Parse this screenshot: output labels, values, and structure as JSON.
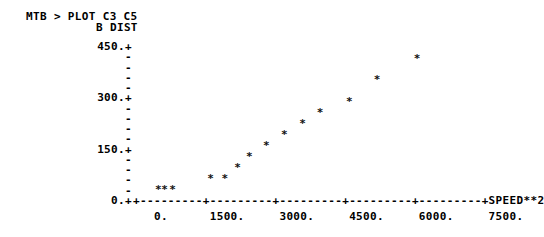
{
  "terminal": {
    "prompt_line": "MTB > PLOT C3 C5",
    "y_axis_title": "B DIST",
    "x_axis_line": "+---------+---------+---------+---------+---------+SPEED**2",
    "x_label_line": "   0.      1500.     3000.     4500.     6000.     7500.",
    "y_axis_rows": [
      "450.+",
      "    -",
      "    -",
      "    -",
      "    -",
      "300.+",
      "    -",
      "    -",
      "    -",
      "    -",
      "150.+",
      "    -",
      "    -",
      "    -",
      "    -",
      "  0.+"
    ],
    "marker": "*"
  },
  "chart_data": {
    "type": "scatter",
    "title": "",
    "xlabel": "SPEED**2",
    "ylabel": "B DIST",
    "xlim": [
      0,
      8250
    ],
    "ylim": [
      0,
      450
    ],
    "grid": false,
    "legend": null,
    "xticks": [
      0,
      1500,
      3000,
      4500,
      6000,
      7500
    ],
    "xticklabels": [
      "0.",
      "1500.",
      "3000.",
      "4500.",
      "6000.",
      "7500."
    ],
    "yticks": [
      0,
      150,
      300,
      450
    ],
    "yticklabels": [
      "0.",
      "150.",
      "300.",
      "450."
    ],
    "y_minor_tick_count_between_majors": 4,
    "n_points": 14,
    "marker": "*",
    "points": [
      {
        "x": 400,
        "y": 20
      },
      {
        "x": 550,
        "y": 20
      },
      {
        "x": 740,
        "y": 20
      },
      {
        "x": 1640,
        "y": 52
      },
      {
        "x": 1980,
        "y": 52
      },
      {
        "x": 2280,
        "y": 85
      },
      {
        "x": 2560,
        "y": 117
      },
      {
        "x": 2960,
        "y": 148
      },
      {
        "x": 3390,
        "y": 180
      },
      {
        "x": 3820,
        "y": 211
      },
      {
        "x": 4240,
        "y": 243
      },
      {
        "x": 4930,
        "y": 275
      },
      {
        "x": 5590,
        "y": 338
      },
      {
        "x": 6540,
        "y": 400
      }
    ]
  }
}
